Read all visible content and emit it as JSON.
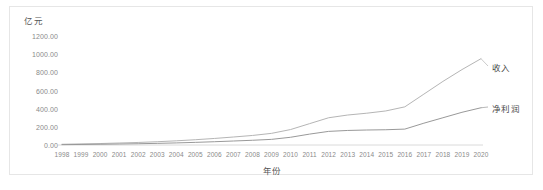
{
  "chart_data": {
    "type": "line",
    "title": "",
    "xlabel": "年份",
    "ylabel": "亿元",
    "unit_label": "亿元",
    "grid": false,
    "legend_position": "inline-right",
    "ylim": [
      0,
      1200
    ],
    "ytick_labels": [
      "1200.00",
      "1000.00",
      "800.00",
      "600.00",
      "400.00",
      "200.00",
      "0.00"
    ],
    "ytick_values": [
      1200,
      1000,
      800,
      600,
      400,
      200,
      0
    ],
    "categories": [
      "1998",
      "1999",
      "2000",
      "2001",
      "2002",
      "2003",
      "2004",
      "2005",
      "2006",
      "2007",
      "2008",
      "2009",
      "2010",
      "2011",
      "2012",
      "2013",
      "2014",
      "2015",
      "2016",
      "2017",
      "2018",
      "2019",
      "2020"
    ],
    "series": [
      {
        "name": "收入",
        "color": "#b5b5b5",
        "values": [
          8,
          12,
          16,
          22,
          28,
          36,
          46,
          58,
          72,
          88,
          105,
          128,
          170,
          235,
          300,
          330,
          350,
          375,
          420,
          560,
          700,
          830,
          950
        ]
      },
      {
        "name": "净利润",
        "color": "#999999",
        "values": [
          4,
          6,
          8,
          11,
          14,
          18,
          23,
          29,
          36,
          44,
          52,
          62,
          85,
          120,
          150,
          160,
          165,
          168,
          175,
          240,
          300,
          360,
          410
        ]
      }
    ]
  },
  "labels": {
    "revenue": "收入",
    "net_profit": "净利润"
  }
}
